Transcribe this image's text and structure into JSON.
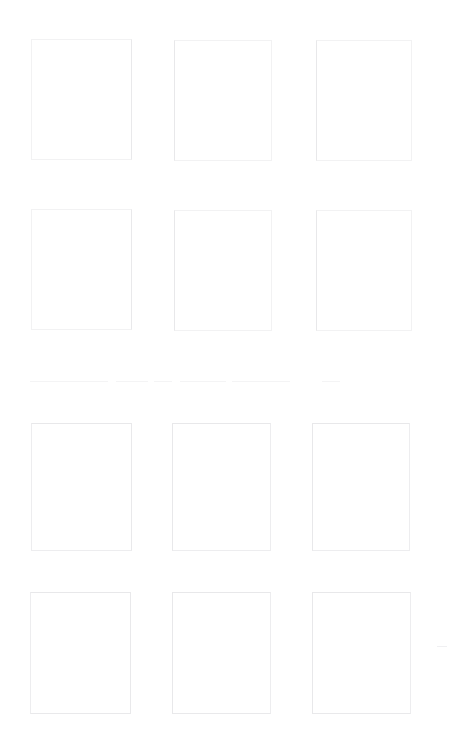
{
  "page": {
    "width": 461,
    "height": 748,
    "background_color": "#ffffff",
    "text_content": ""
  },
  "grid": {
    "columns": 3,
    "rows": 4,
    "cell_count": 12,
    "border_color_faintest": "#f2f2f3",
    "border_color_faint": "#ededef",
    "cells": [
      {
        "id": "cell-r1c1",
        "row": 1,
        "column": 1,
        "x": 31,
        "y": 39,
        "width": 101,
        "height": 121,
        "tone": "tone-faintest",
        "content": ""
      },
      {
        "id": "cell-r1c2",
        "row": 1,
        "column": 2,
        "x": 174,
        "y": 40,
        "width": 98,
        "height": 121,
        "tone": "tone-faintest",
        "content": ""
      },
      {
        "id": "cell-r1c3",
        "row": 1,
        "column": 3,
        "x": 316,
        "y": 40,
        "width": 96,
        "height": 121,
        "tone": "tone-faintest",
        "content": ""
      },
      {
        "id": "cell-r2c1",
        "row": 2,
        "column": 1,
        "x": 31,
        "y": 209,
        "width": 101,
        "height": 121,
        "tone": "tone-faintest",
        "content": ""
      },
      {
        "id": "cell-r2c2",
        "row": 2,
        "column": 2,
        "x": 174,
        "y": 210,
        "width": 98,
        "height": 121,
        "tone": "tone-faintest",
        "content": ""
      },
      {
        "id": "cell-r2c3",
        "row": 2,
        "column": 3,
        "x": 316,
        "y": 210,
        "width": 96,
        "height": 121,
        "tone": "tone-faintest",
        "content": ""
      },
      {
        "id": "cell-r3c1",
        "row": 3,
        "column": 1,
        "x": 31,
        "y": 423,
        "width": 101,
        "height": 128,
        "tone": "tone-faint",
        "content": ""
      },
      {
        "id": "cell-r3c2",
        "row": 3,
        "column": 2,
        "x": 172,
        "y": 423,
        "width": 99,
        "height": 128,
        "tone": "tone-faint",
        "content": ""
      },
      {
        "id": "cell-r3c3",
        "row": 3,
        "column": 3,
        "x": 312,
        "y": 423,
        "width": 98,
        "height": 128,
        "tone": "tone-faint",
        "content": ""
      },
      {
        "id": "cell-r4c1",
        "row": 4,
        "column": 1,
        "x": 30,
        "y": 592,
        "width": 101,
        "height": 122,
        "tone": "tone-faint",
        "content": ""
      },
      {
        "id": "cell-r4c2",
        "row": 4,
        "column": 2,
        "x": 172,
        "y": 592,
        "width": 99,
        "height": 122,
        "tone": "tone-faint",
        "content": ""
      },
      {
        "id": "cell-r4c3",
        "row": 4,
        "column": 3,
        "x": 312,
        "y": 592,
        "width": 99,
        "height": 122,
        "tone": "tone-faint",
        "content": ""
      }
    ]
  },
  "divider": {
    "id": "divider-rule",
    "y": 381,
    "x": 30,
    "width": 310,
    "color": "#f4f4f5",
    "style": "broken",
    "segments": [
      {
        "x": 0,
        "width": 78
      },
      {
        "x": 86,
        "width": 32
      },
      {
        "x": 124,
        "width": 18
      },
      {
        "x": 150,
        "width": 46
      },
      {
        "x": 202,
        "width": 58
      },
      {
        "x": 292,
        "width": 18
      }
    ]
  },
  "artifacts": [
    {
      "id": "stray-dash",
      "x": 437,
      "y": 646,
      "width": 10,
      "height": 1,
      "color": "#f0f0f2"
    }
  ]
}
